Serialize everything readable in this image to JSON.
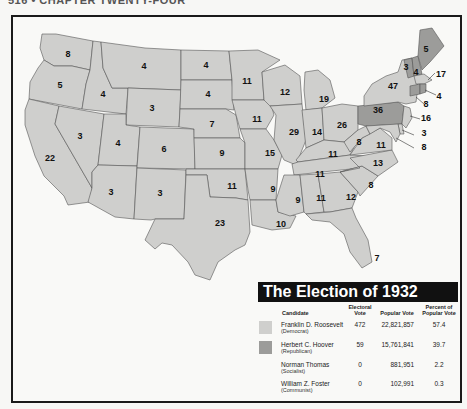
{
  "page_header": "516 • CHAPTER TWENTY-FOUR",
  "map": {
    "colors": {
      "democrat": "#cfcfcd",
      "republican": "#9c9c9a",
      "border": "#555555",
      "frame": "#1a1a1a"
    },
    "states": {
      "WA": "8",
      "OR": "5",
      "CA": "22",
      "ID": "4",
      "NV": "3",
      "MT": "4",
      "WY": "3",
      "UT": "4",
      "AZ": "3",
      "CO": "6",
      "NM": "3",
      "ND": "4",
      "SD": "4",
      "NE": "7",
      "KS": "9",
      "OK": "11",
      "TX": "23",
      "MN": "11",
      "IA": "11",
      "MO": "15",
      "AR": "9",
      "LA": "10",
      "WI": "12",
      "IL": "29",
      "MI": "19",
      "IN": "14",
      "OH": "26",
      "KY": "11",
      "TN": "11",
      "MS": "9",
      "AL": "11",
      "GA": "12",
      "FL": "7",
      "SC": "8",
      "NC": "13",
      "VA": "11",
      "WV": "8",
      "PA": "36",
      "NY": "47",
      "VT": "3",
      "NH": "4",
      "ME": "5",
      "MA": "17",
      "CT": "8",
      "RI": "4",
      "NJ": "16",
      "DE": "3",
      "MD": "8"
    }
  },
  "legend": {
    "title": "The Election of 1932",
    "headers": {
      "candidate": "Candidate",
      "electoral": "Electoral Vote",
      "popular": "Popular Vote",
      "percent": "Percent of Popular Vote"
    },
    "rows": [
      {
        "name": "Franklin D. Roosevelt",
        "party": "(Democrat)",
        "electoral": "472",
        "popular": "22,821,857",
        "percent": "57.4",
        "color": "#cfcfcd"
      },
      {
        "name": "Herbert C. Hoover",
        "party": "(Republican)",
        "electoral": "59",
        "popular": "15,761,841",
        "percent": "39.7",
        "color": "#9c9c9a"
      },
      {
        "name": "Norman Thomas",
        "party": "(Socialist)",
        "electoral": "0",
        "popular": "881,951",
        "percent": "2.2",
        "color": ""
      },
      {
        "name": "William Z. Foster",
        "party": "(Communist)",
        "electoral": "0",
        "popular": "102,991",
        "percent": "0.3",
        "color": ""
      }
    ]
  }
}
